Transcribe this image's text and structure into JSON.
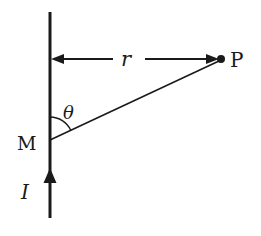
{
  "diagram": {
    "labels": {
      "distance": "r",
      "point": "P",
      "element": "M",
      "angle": "θ",
      "current": "I"
    },
    "colors": {
      "stroke": "#1a1a1a",
      "background": "#ffffff"
    },
    "geometry": {
      "wire": {
        "x": 50,
        "y1": 12,
        "y2": 218
      },
      "point_P": {
        "x": 221,
        "y": 59
      },
      "point_M": {
        "x": 50,
        "y": 140
      },
      "distance_arrow_y": 59
    }
  }
}
